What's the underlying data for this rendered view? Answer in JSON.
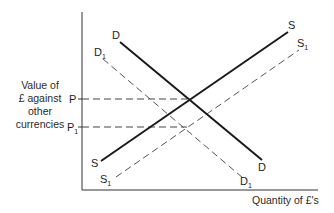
{
  "diagram": {
    "type": "supply-demand",
    "y_axis_label_lines": [
      "Value of",
      "£ against",
      "other",
      "currencies"
    ],
    "x_axis_label": "Quantity of £'s",
    "price_labels": {
      "p": {
        "main": "P",
        "sub": ""
      },
      "p1": {
        "main": "P",
        "sub": "1"
      }
    },
    "curves": {
      "d": {
        "main": "D",
        "sub": "",
        "style": "solid"
      },
      "d1": {
        "main": "D",
        "sub": "1",
        "style": "dashed"
      },
      "s": {
        "main": "S",
        "sub": "",
        "style": "solid"
      },
      "s1": {
        "main": "S",
        "sub": "1",
        "style": "dashed"
      }
    },
    "colors": {
      "solid_line": "#1a1a1a",
      "dashed_line": "#555555",
      "axis": "#333333",
      "text": "#222222"
    }
  }
}
